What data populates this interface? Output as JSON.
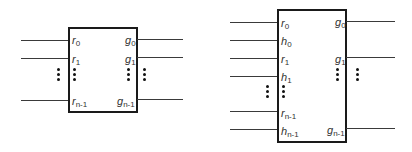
{
  "diagram": {
    "left_block": {
      "inputs": [
        {
          "var": "r",
          "sub": "0"
        },
        {
          "var": "r",
          "sub": "1"
        },
        {
          "var": "r",
          "sub": "n-1"
        }
      ],
      "outputs": [
        {
          "var": "g",
          "sub": "0"
        },
        {
          "var": "g",
          "sub": "1"
        },
        {
          "var": "g",
          "sub": "n-1"
        }
      ]
    },
    "right_block": {
      "inputs": [
        {
          "var": "r",
          "sub": "0"
        },
        {
          "var": "h",
          "sub": "0"
        },
        {
          "var": "r",
          "sub": "1"
        },
        {
          "var": "h",
          "sub": "1"
        },
        {
          "var": "r",
          "sub": "n-1"
        },
        {
          "var": "h",
          "sub": "n-1"
        }
      ],
      "outputs": [
        {
          "var": "g",
          "sub": "0"
        },
        {
          "var": "g",
          "sub": "1"
        },
        {
          "var": "g",
          "sub": "n-1"
        }
      ]
    },
    "colors": {
      "line": "#3a3a3a",
      "box_border": "#1a1a1a",
      "text": "#333333"
    }
  }
}
